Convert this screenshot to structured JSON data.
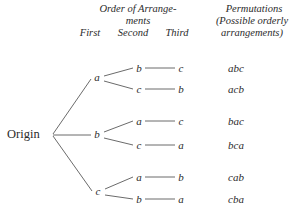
{
  "diagram": {
    "title_text": "Tree diagram of permutations of three objects",
    "origin_label": "Origin",
    "headers": {
      "order_line1": "Order of Arrange-",
      "order_line2": "ments",
      "col_first": "First",
      "col_second": "Second",
      "col_third": "Third",
      "perm_line1": "Permutations",
      "perm_line2": "(Possible orderly",
      "perm_line3": "arrangements)"
    },
    "level1": [
      {
        "label": "a",
        "x": 97,
        "y": 78
      },
      {
        "label": "b",
        "x": 97,
        "y": 135
      },
      {
        "label": "c",
        "x": 98,
        "y": 192
      }
    ],
    "level2": [
      {
        "label": "b",
        "x": 139,
        "y": 69
      },
      {
        "label": "c",
        "x": 139,
        "y": 90
      },
      {
        "label": "a",
        "x": 139,
        "y": 122
      },
      {
        "label": "c",
        "x": 139,
        "y": 146
      },
      {
        "label": "a",
        "x": 139,
        "y": 178
      },
      {
        "label": "b",
        "x": 139,
        "y": 200
      }
    ],
    "level3": [
      {
        "label": "c",
        "x": 181,
        "y": 69
      },
      {
        "label": "b",
        "x": 181,
        "y": 90
      },
      {
        "label": "c",
        "x": 181,
        "y": 122
      },
      {
        "label": "a",
        "x": 181,
        "y": 146
      },
      {
        "label": "b",
        "x": 181,
        "y": 178
      },
      {
        "label": "a",
        "x": 181,
        "y": 200
      }
    ],
    "permutations": [
      {
        "label": "abc",
        "x": 236,
        "y": 69
      },
      {
        "label": "acb",
        "x": 236,
        "y": 90
      },
      {
        "label": "bac",
        "x": 236,
        "y": 122
      },
      {
        "label": "bca",
        "x": 236,
        "y": 146
      },
      {
        "label": "cab",
        "x": 236,
        "y": 178
      },
      {
        "label": "cba",
        "x": 236,
        "y": 200
      }
    ],
    "colors": {
      "background": "#ffffff",
      "ink": "#2b2b2b",
      "line": "#6b6b6b"
    }
  },
  "chart_data": {
    "type": "diagram",
    "root": "Origin",
    "branch_counts": [
      3,
      2,
      1
    ],
    "total_permutations": 6,
    "paths": [
      {
        "first": "a",
        "second": "b",
        "third": "c",
        "permutation": "abc"
      },
      {
        "first": "a",
        "second": "c",
        "third": "b",
        "permutation": "acb"
      },
      {
        "first": "b",
        "second": "a",
        "third": "c",
        "permutation": "bac"
      },
      {
        "first": "b",
        "second": "c",
        "third": "a",
        "permutation": "bca"
      },
      {
        "first": "c",
        "second": "a",
        "third": "b",
        "permutation": "cab"
      },
      {
        "first": "c",
        "second": "b",
        "third": "a",
        "permutation": "cba"
      }
    ],
    "column_headers": [
      "First",
      "Second",
      "Third",
      "Permutations"
    ]
  }
}
